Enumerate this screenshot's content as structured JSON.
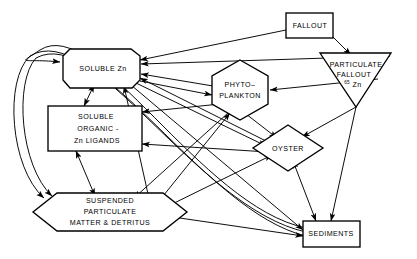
{
  "diagram": {
    "background_color": "#ffffff",
    "line_color": "#000000",
    "nodes": [
      {
        "id": "fallout",
        "name": "fallout",
        "label": "FALLOUT",
        "shape": "rectangle",
        "cx": 310,
        "cy": 26
      },
      {
        "id": "particulate_fallout",
        "name": "particulate-fallout",
        "label_line1": "PARTICULATE",
        "label_line2": "FALLOUT",
        "label_sup": "65",
        "label_element": "Zn",
        "shape": "triangle-down",
        "cx": 355,
        "cy": 72
      },
      {
        "id": "soluble_zn",
        "name": "soluble-zn",
        "label": "SOLUBLE  Zn",
        "shape": "octagon",
        "cx": 110,
        "cy": 68
      },
      {
        "id": "phytoplankton",
        "name": "phytoplankton",
        "label_line1": "PHYTO–",
        "label_line2": "PLANKTON",
        "shape": "hexagon-vertical",
        "cx": 240,
        "cy": 89
      },
      {
        "id": "soluble_organic",
        "name": "soluble-organic-zn-ligands",
        "label_line1": "SOLUBLE",
        "label_line2": "ORGANIC -",
        "label_line3": "Zn LIGANDS",
        "shape": "rectangle",
        "cx": 110,
        "cy": 129
      },
      {
        "id": "oyster",
        "name": "oyster",
        "label": "OYSTER",
        "shape": "diamond",
        "cx": 288,
        "cy": 148
      },
      {
        "id": "suspended_particulate",
        "name": "suspended-particulate-matter-detritus",
        "label_line1": "SUSPENDED",
        "label_line2": "PARTICULATE",
        "label_line3": "MATTER & DETRITUS",
        "shape": "hexagon-horizontal",
        "cx": 110,
        "cy": 212
      },
      {
        "id": "sediments",
        "name": "sediments",
        "label": "SEDIMENTS",
        "shape": "rectangle",
        "cx": 325,
        "cy": 234
      }
    ],
    "edges": [
      {
        "from": "fallout",
        "to": "soluble_zn",
        "heads": 1
      },
      {
        "from": "fallout",
        "to": "particulate_fallout",
        "heads": 1
      },
      {
        "from": "particulate_fallout",
        "to": "soluble_zn",
        "heads": 1
      },
      {
        "from": "particulate_fallout",
        "to": "phytoplankton",
        "heads": 1
      },
      {
        "from": "particulate_fallout",
        "to": "oyster",
        "heads": 1
      },
      {
        "from": "particulate_fallout",
        "to": "sediments",
        "heads": 1
      },
      {
        "from": "soluble_zn",
        "to": "soluble_organic",
        "heads": 2
      },
      {
        "from": "soluble_zn",
        "to": "phytoplankton",
        "heads": 1
      },
      {
        "from": "soluble_zn",
        "to": "oyster",
        "heads": 1
      },
      {
        "from": "soluble_zn",
        "to": "sediments",
        "heads": 1
      },
      {
        "from": "soluble_organic",
        "to": "suspended_particulate",
        "heads": 2
      },
      {
        "from": "phytoplankton",
        "to": "soluble_zn",
        "heads": 1
      },
      {
        "from": "phytoplankton",
        "to": "soluble_organic",
        "heads": 1
      },
      {
        "from": "phytoplankton",
        "to": "oyster",
        "heads": 1
      },
      {
        "from": "phytoplankton",
        "to": "suspended_particulate",
        "heads": 1
      },
      {
        "from": "oyster",
        "to": "soluble_zn",
        "heads": 1
      },
      {
        "from": "oyster",
        "to": "soluble_organic",
        "heads": 1
      },
      {
        "from": "oyster",
        "to": "sediments",
        "heads": 2
      },
      {
        "from": "suspended_particulate",
        "to": "soluble_zn",
        "heads": 1
      },
      {
        "from": "suspended_particulate",
        "to": "phytoplankton",
        "heads": 1
      },
      {
        "from": "suspended_particulate",
        "to": "oyster",
        "heads": 1
      },
      {
        "from": "suspended_particulate",
        "to": "sediments",
        "heads": 1
      },
      {
        "from": "sediments",
        "to": "soluble_zn",
        "heads": 1
      },
      {
        "from": "sediments",
        "to": "soluble_organic",
        "heads": 1
      },
      {
        "from": "sediments",
        "to": "suspended_particulate",
        "heads": 1
      }
    ]
  }
}
